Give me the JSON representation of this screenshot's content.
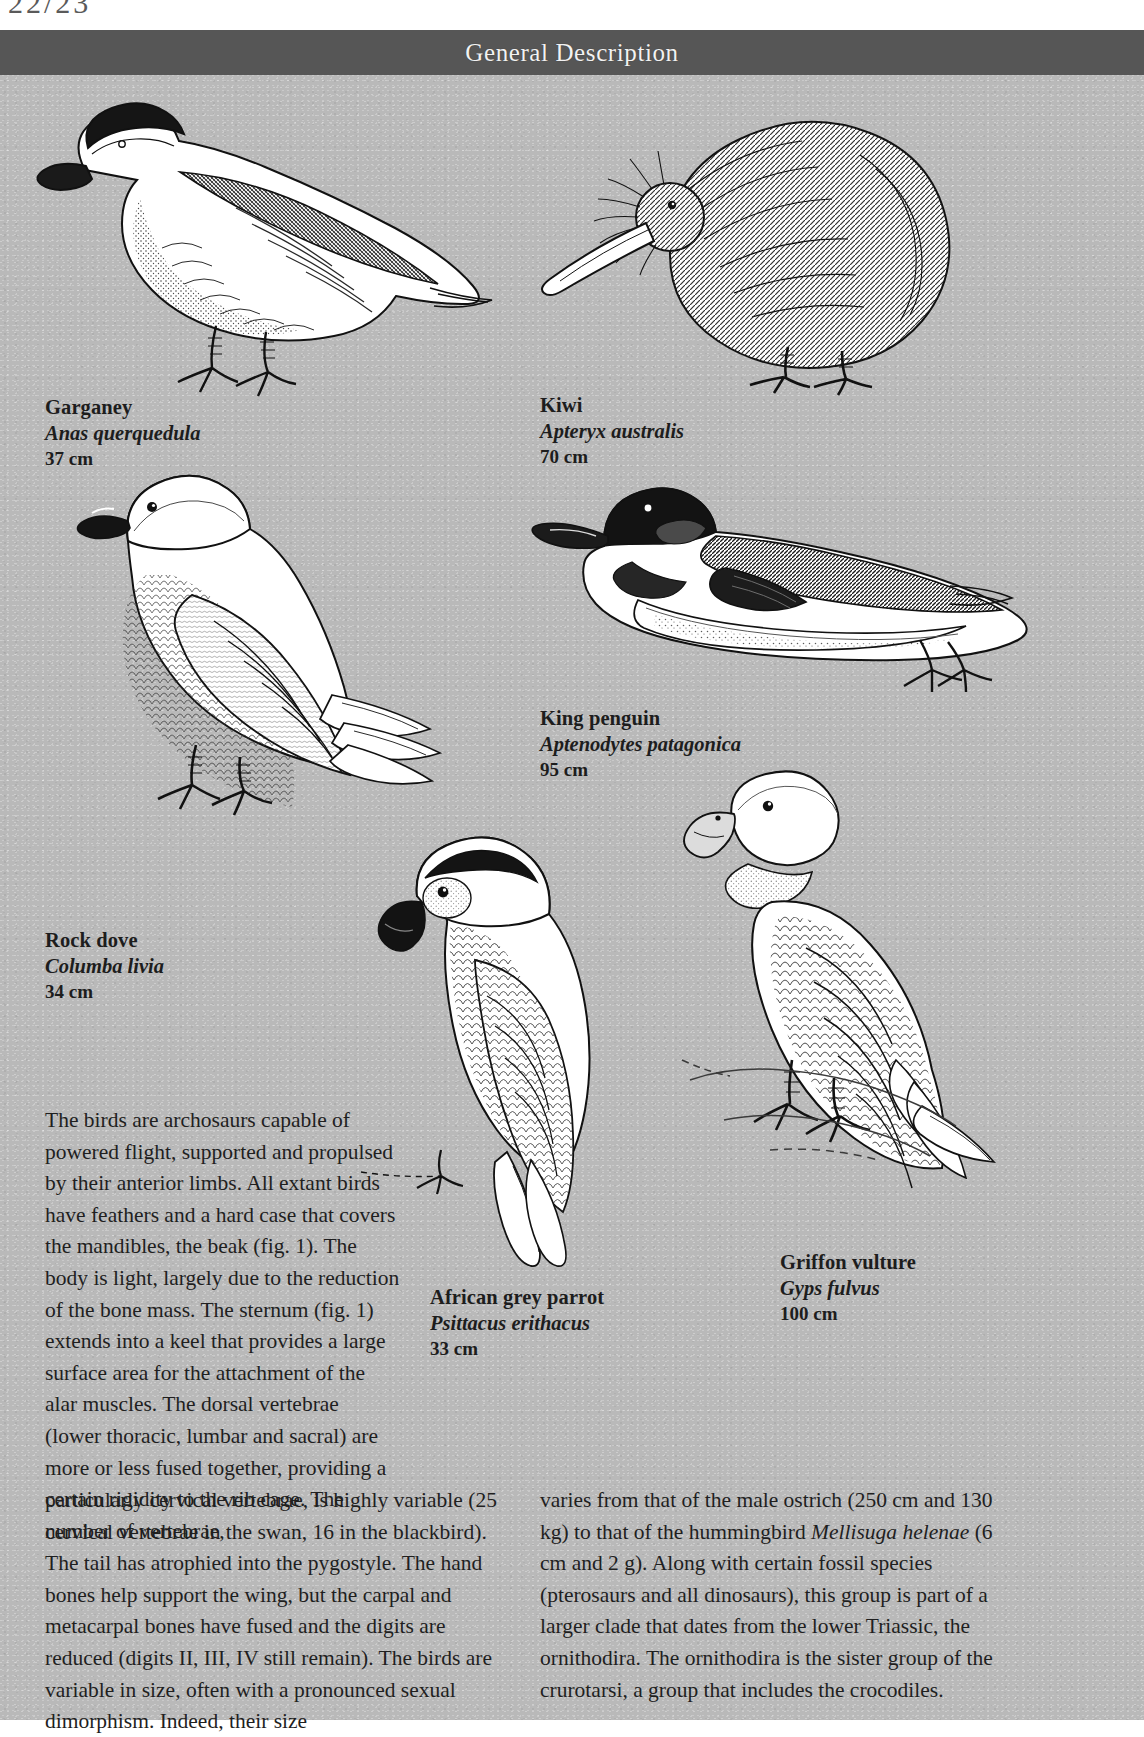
{
  "page": {
    "header_title": "General Description",
    "top_margin_glyph": "22/23",
    "background_color": "#b9b9b9",
    "header_color": "#565656",
    "text_color": "#1f1f1f"
  },
  "figures": [
    {
      "id": "garganey",
      "icon": "duck-illustration",
      "caption": {
        "common": "Garganey",
        "latin": "Anas querquedula",
        "size": "37 cm"
      }
    },
    {
      "id": "kiwi",
      "icon": "kiwi-illustration",
      "caption": {
        "common": "Kiwi",
        "latin": "Apteryx australis",
        "size": "70 cm"
      }
    },
    {
      "id": "rock-dove",
      "icon": "pigeon-illustration",
      "caption": {
        "common": "Rock dove",
        "latin": "Columba livia",
        "size": "34 cm"
      }
    },
    {
      "id": "king-penguin",
      "icon": "penguin-illustration",
      "caption": {
        "common": "King penguin",
        "latin": "Aptenodytes patagonica",
        "size": "95 cm"
      }
    },
    {
      "id": "african-grey-parrot",
      "icon": "parrot-illustration",
      "caption": {
        "common": "African grey parrot",
        "latin": "Psittacus erithacus",
        "size": "33 cm"
      }
    },
    {
      "id": "griffon-vulture",
      "icon": "vulture-illustration",
      "caption": {
        "common": "Griffon vulture",
        "latin": "Gyps fulvus",
        "size": "100 cm"
      }
    }
  ],
  "body": {
    "narrow_column": "The birds are archosaurs capable of powered flight, supported and propulsed by their anterior limbs. All extant birds have feathers and a hard case that covers the mandibles, the beak (fig. 1). The body is light, largely due to the reduction of the bone mass. The sternum (fig. 1) extends into a keel that provides a large surface area for the attachment of the alar muscles. The dorsal vertebrae (lower thoracic, lumbar and sacral) are more or less fused together, providing a certain rigidity to the rib cage. The number of vertebrae,",
    "bottom_left_column": "particularly cervical vertebrae, is highly variable (25 cervical vertebrae in the swan, 16 in the blackbird). The tail has atrophied into the pygostyle. The hand bones help support the wing, but the carpal and metacarpal bones have fused and the digits are reduced (digits II, III, IV still remain). The birds are variable in size, often with a pronounced sexual dimorphism. Indeed, their size",
    "bottom_right_column_part1": "varies from that of the male ostrich (250 cm and 130 kg) to that of the hummingbird ",
    "bottom_right_italic1": "Mellisuga helenae",
    "bottom_right_column_part2": " (6 cm and 2 g). Along with certain fossil species (pterosaurs and all dinosaurs), this group is part of a larger clade that dates from the lower Triassic, the ornithodira. The ornithodira is the sister group of the crurotarsi, a group that includes the crocodiles."
  }
}
